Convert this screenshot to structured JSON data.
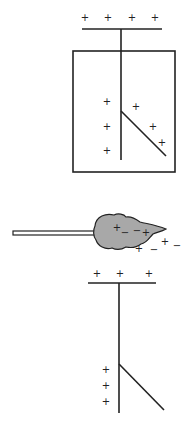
{
  "diagram": {
    "colors": {
      "line": "#222222",
      "flame_fill": "#a8a8a8",
      "rod_fill": "#ffffff",
      "background": "#ffffff"
    },
    "top_electroscope": {
      "top_charges": [
        "+",
        "+",
        "+",
        "+"
      ],
      "left_charges": [
        "+",
        "+",
        "+"
      ],
      "leaf_charges": [
        "+",
        "+",
        "+"
      ]
    },
    "flame": {
      "inside_charges": [
        "+",
        "−",
        "−",
        "+"
      ],
      "outside_charges": [
        "+",
        "−",
        "+",
        "−"
      ]
    },
    "bottom_electroscope": {
      "top_charges": [
        "+",
        "+",
        "+"
      ],
      "left_charges": [
        "+",
        "+",
        "+"
      ]
    }
  }
}
